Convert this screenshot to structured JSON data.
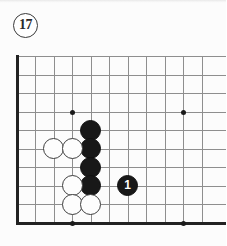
{
  "figure": {
    "number_label": "17",
    "circled": true
  },
  "board": {
    "size": 19,
    "visible_columns": 11,
    "visible_rows": 10,
    "line_color": "#8e8e8e",
    "edge_color": "#222222",
    "background_color": "#fcfcfc",
    "star_points": [
      {
        "col": 4,
        "row": 4
      },
      {
        "col": 10,
        "row": 4
      },
      {
        "col": 4,
        "row": 10
      },
      {
        "col": 10,
        "row": 10
      }
    ],
    "stones": [
      {
        "color": "black",
        "col": 5,
        "row": 5,
        "label": ""
      },
      {
        "color": "black",
        "col": 5,
        "row": 6,
        "label": ""
      },
      {
        "color": "black",
        "col": 5,
        "row": 7,
        "label": ""
      },
      {
        "color": "black",
        "col": 5,
        "row": 8,
        "label": ""
      },
      {
        "color": "white",
        "col": 3,
        "row": 6,
        "label": ""
      },
      {
        "color": "white",
        "col": 4,
        "row": 6,
        "label": ""
      },
      {
        "color": "white",
        "col": 4,
        "row": 8,
        "label": ""
      },
      {
        "color": "white",
        "col": 4,
        "row": 9,
        "label": ""
      },
      {
        "color": "white",
        "col": 5,
        "row": 9,
        "label": ""
      },
      {
        "color": "black",
        "col": 7,
        "row": 8,
        "label": "1"
      }
    ]
  }
}
